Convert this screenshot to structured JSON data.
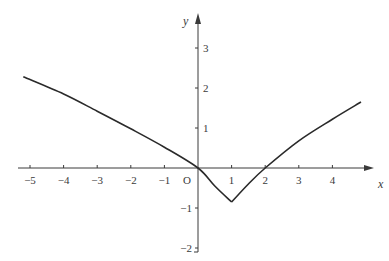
{
  "chart_data": {
    "type": "line",
    "title": "",
    "xlabel": "x",
    "ylabel": "y",
    "origin_label": "O",
    "xlim": [
      -5.2,
      5.2
    ],
    "ylim": [
      -2,
      3.6
    ],
    "grid": false,
    "legend": null,
    "x_ticks": [
      -5,
      -4,
      -3,
      -2,
      -1,
      1,
      2,
      3,
      4
    ],
    "x_tick_labels": [
      "−5",
      "−4",
      "−3",
      "−2",
      "−1",
      "1",
      "2",
      "3",
      "4"
    ],
    "y_ticks": [
      3,
      2,
      1,
      -1,
      -2
    ],
    "y_tick_labels": [
      "3",
      "2",
      "1",
      "−1",
      "−2"
    ],
    "series": [
      {
        "name": "curve",
        "color": "#2a2a2a",
        "x": [
          -5.2,
          -4,
          -3,
          -2,
          -1,
          0,
          0.5,
          1,
          1.5,
          2,
          3,
          4,
          4.85
        ],
        "y": [
          2.28,
          1.85,
          1.42,
          0.98,
          0.52,
          0,
          -0.45,
          -0.85,
          -0.4,
          0,
          0.68,
          1.22,
          1.65
        ]
      }
    ],
    "annotations": [
      "cusp minimum at (1, -0.85)",
      "zeros at x=0 and x=2"
    ]
  },
  "colors": {
    "axis": "#3a3a3a",
    "curve": "#2a2a2a",
    "background": "#ffffff"
  }
}
